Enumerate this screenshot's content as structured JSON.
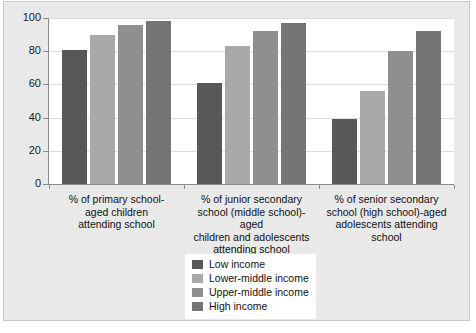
{
  "chart_data": {
    "type": "bar",
    "title": "",
    "subtitle": "",
    "xlabel": "",
    "ylabel": "",
    "ylim": [
      0,
      100
    ],
    "yticks": [
      0,
      20,
      40,
      60,
      80,
      100
    ],
    "ytick_labels": [
      "0",
      "20",
      "40",
      "60",
      "80",
      "100"
    ],
    "grid": true,
    "legend_position": "bottom-center",
    "categories": [
      "% of primary school-aged children attending school",
      "% of junior secondary school (middle school)-aged children and adolescents attending school",
      "% of senior secondary school (high school)-aged adolescents attending school"
    ],
    "category_lines": [
      [
        "% of primary school-",
        "aged children",
        "attending school"
      ],
      [
        "% of junior secondary",
        "school (middle school)-aged",
        "children and adolescents",
        "attending school"
      ],
      [
        "% of senior secondary",
        "school (high school)-aged",
        "adolescents attending",
        "school"
      ]
    ],
    "series": [
      {
        "name": "Low income",
        "color": "#585858",
        "values": [
          81,
          61,
          39
        ]
      },
      {
        "name": "Lower-middle income",
        "color": "#a9a9a9",
        "values": [
          90,
          83,
          56
        ]
      },
      {
        "name": "Upper-middle income",
        "color": "#8f8f8f",
        "values": [
          96,
          92,
          80
        ]
      },
      {
        "name": "High income",
        "color": "#757575",
        "values": [
          98,
          97,
          92
        ]
      }
    ]
  },
  "legend": {
    "items": [
      {
        "label": "Low income",
        "color": "#585858"
      },
      {
        "label": "Lower-middle income",
        "color": "#a9a9a9"
      },
      {
        "label": "Upper-middle income",
        "color": "#8f8f8f"
      },
      {
        "label": "High income",
        "color": "#757575"
      }
    ]
  },
  "colors": {
    "plot_background": "#ffffff",
    "canvas_background": "#e9e9e9",
    "gridline": "#dcdcdc",
    "axis": "#8a8a8a",
    "text": "#111111"
  }
}
